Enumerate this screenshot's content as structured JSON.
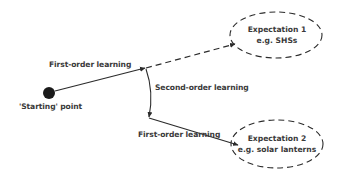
{
  "diagram": {
    "start_node": {
      "label": "'Starting' point",
      "shape": "filled-circle",
      "color": "#1a1a1a"
    },
    "edges": [
      {
        "id": "first-order-1",
        "label": "First-order learning",
        "style": "solid",
        "from": "start",
        "to": "branch-point"
      },
      {
        "id": "dashed-to-exp1",
        "label": "",
        "style": "dashed",
        "from": "branch-point",
        "to": "expectation-1"
      },
      {
        "id": "second-order",
        "label": "Second-order learning",
        "style": "solid-curved",
        "from": "branch-point",
        "to": "redirect-point"
      },
      {
        "id": "first-order-2",
        "label": "First-order learning",
        "style": "solid",
        "from": "redirect-point",
        "to": "expectation-2"
      }
    ],
    "nodes": [
      {
        "id": "expectation-1",
        "title": "Expectation 1",
        "subtitle": "e.g. SHSs",
        "shape": "dashed-ellipse"
      },
      {
        "id": "expectation-2",
        "title": "Expectation 2",
        "subtitle": "e.g. solar lanterns",
        "shape": "dashed-ellipse"
      }
    ],
    "colors": {
      "line": "#2b2b2b",
      "text": "#3a3a3a",
      "background": "#ffffff"
    }
  }
}
